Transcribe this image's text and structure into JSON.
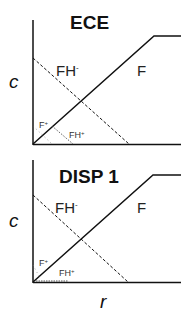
{
  "panels": [
    {
      "title": "ECE",
      "ylabel": "c",
      "labels": {
        "fh_minus": "FH",
        "fh_minus_sup": "-",
        "f": "F",
        "f_plus": "F",
        "f_plus_sup": "+",
        "fh_plus": "FH",
        "fh_plus_sup": "+"
      }
    },
    {
      "title": "DISP 1",
      "ylabel": "c",
      "labels": {
        "fh_minus": "FH",
        "fh_minus_sup": "-",
        "f": "F",
        "f_plus": "F",
        "f_plus_sup": "+",
        "fh_plus": "FH",
        "fh_plus_sup": "+"
      }
    }
  ],
  "xlabel": "r",
  "colors": {
    "line": "#111111",
    "background": "#ffffff"
  }
}
